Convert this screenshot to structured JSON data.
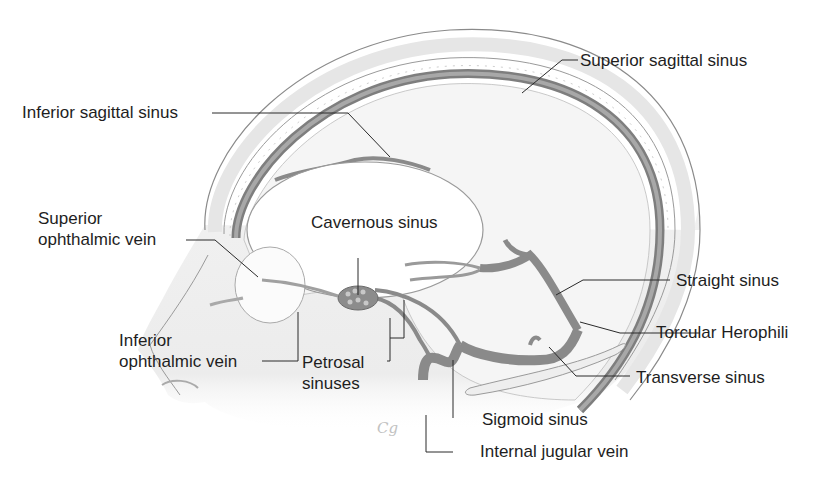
{
  "diagram": {
    "colors": {
      "background": "#ffffff",
      "skull_fill": "#efefef",
      "skull_outline": "#8a8a8a",
      "sinus_fill": "#8c8c8c",
      "sinus_outline": "#5e5e5e",
      "brain_fill": "#f4f4f4",
      "leader_line": "#2a2a2a",
      "text": "#1e1e1e"
    },
    "labels": [
      {
        "id": "superior-sagittal-sinus",
        "text": "Superior sagittal sinus"
      },
      {
        "id": "inferior-sagittal-sinus",
        "text": "Inferior sagittal sinus"
      },
      {
        "id": "superior-ophthalmic-vein",
        "text": "Superior\nophthalmic vein"
      },
      {
        "id": "cavernous-sinus",
        "text": "Cavernous sinus"
      },
      {
        "id": "straight-sinus",
        "text": "Straight sinus"
      },
      {
        "id": "inferior-ophthalmic-vein",
        "text": "Inferior\nophthalmic vein"
      },
      {
        "id": "petrosal-sinuses",
        "text": "Petrosal\nsinuses"
      },
      {
        "id": "torcular-herophili",
        "text": "Torcular Herophili"
      },
      {
        "id": "transverse-sinus",
        "text": "Transverse sinus"
      },
      {
        "id": "sigmoid-sinus",
        "text": "Sigmoid sinus"
      },
      {
        "id": "internal-jugular-vein",
        "text": "Internal jugular vein"
      }
    ],
    "signature": "Cg"
  }
}
